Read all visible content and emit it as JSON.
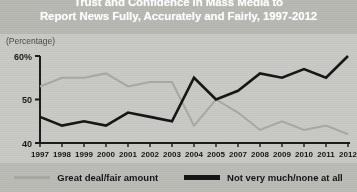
{
  "title": {
    "line1": "Trust and Confidence in Mass Media to",
    "line2": "Report News Fully, Accurately and Fairly, 1997-2012"
  },
  "axis_note": "(Percentage)",
  "legend": {
    "items": [
      {
        "label": "Great deal/fair amount",
        "color": "#a9a9a4",
        "swatch": "line-swatch-light"
      },
      {
        "label": "Not very much/none at all",
        "color": "#161616",
        "swatch": "line-swatch-dark"
      }
    ]
  },
  "chart_data": {
    "type": "line",
    "title": "Trust and Confidence in Mass Media to Report News Fully, Accurately and Fairly, 1997-2012",
    "xlabel": "",
    "ylabel": "(Percentage)",
    "ylim": [
      40,
      60
    ],
    "yticks": [
      40,
      50,
      60
    ],
    "ytick_labels": [
      "40",
      "50",
      "60%"
    ],
    "grid": false,
    "legend_position": "bottom",
    "categories": [
      "1997",
      "1998",
      "1999",
      "2000",
      "2001",
      "2002",
      "2003",
      "2004",
      "2005",
      "2007",
      "2008",
      "2009",
      "2010",
      "2011",
      "2012"
    ],
    "series": [
      {
        "name": "Great deal/fair amount",
        "color": "#a9a9a4",
        "values": [
          53,
          55,
          55,
          56,
          53,
          54,
          54,
          44,
          50,
          47,
          43,
          45,
          43,
          44,
          42
        ]
      },
      {
        "name": "Not very much/none at all",
        "color": "#161616",
        "values": [
          46,
          44,
          45,
          44,
          47,
          46,
          45,
          55,
          50,
          52,
          56,
          55,
          57,
          55,
          60
        ]
      }
    ]
  }
}
